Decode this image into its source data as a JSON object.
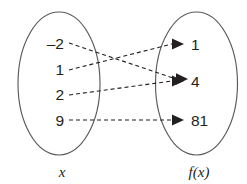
{
  "diagram": {
    "type": "function-mapping-diagram",
    "domain_set": {
      "caption": "x",
      "values": [
        "–2",
        "1",
        "2",
        "9"
      ]
    },
    "range_set": {
      "caption": "f(x)",
      "values": [
        "1",
        "4",
        "81"
      ]
    },
    "mappings": [
      {
        "from": "–2",
        "to": "4"
      },
      {
        "from": "1",
        "to": "1"
      },
      {
        "from": "2",
        "to": "4"
      },
      {
        "from": "9",
        "to": "81"
      }
    ],
    "colors": {
      "background": "#ffffff",
      "ellipse_stroke": "#58595b",
      "arrow_stroke": "#231f20",
      "text": "#231f20"
    }
  }
}
